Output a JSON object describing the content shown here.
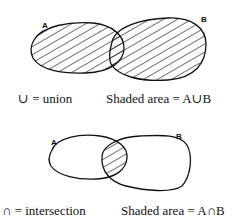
{
  "union_diagram": {
    "set_a_label": "A",
    "set_b_label": "B",
    "symbol_caption": "∪ = union",
    "shaded_caption": "Shaded area = A∪B"
  },
  "intersection_diagram": {
    "set_a_label": "A",
    "set_b_label": "B",
    "symbol_caption": "∩ = intersection",
    "shaded_caption": "Shaded area = A∩B"
  }
}
